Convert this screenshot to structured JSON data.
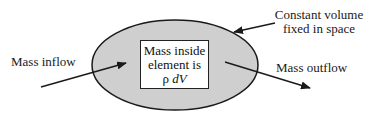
{
  "diagram": {
    "type": "control-volume",
    "labels": {
      "inflow": "Mass inflow",
      "outflow": "Mass outflow",
      "volume_line1": "Constant volume",
      "volume_line2": "fixed in space"
    },
    "element": {
      "line1": "Mass inside",
      "line2": "element is",
      "rho": "ρ",
      "dv": "dV"
    },
    "colors": {
      "ellipse_fill": "#cfcfcf",
      "stroke": "#1a1a1a",
      "box_fill": "#ffffff"
    }
  }
}
